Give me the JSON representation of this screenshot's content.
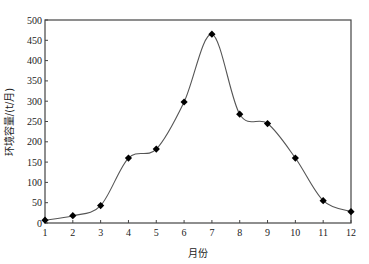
{
  "chart_data": {
    "type": "line",
    "title": "",
    "xlabel": "月份",
    "ylabel": "环境容量/(t/月)",
    "x": [
      1,
      2,
      3,
      4,
      5,
      6,
      7,
      8,
      9,
      10,
      11,
      12
    ],
    "categories": [
      "1",
      "2",
      "3",
      "4",
      "5",
      "6",
      "7",
      "8",
      "9",
      "10",
      "11",
      "12"
    ],
    "series": [
      {
        "name": "环境容量",
        "values": [
          7,
          18,
          43,
          160,
          182,
          298,
          465,
          268,
          245,
          160,
          55,
          28
        ],
        "marker": "diamond",
        "line": "smooth",
        "color": "#000000",
        "line_color": "#555555"
      }
    ],
    "xlim": [
      1,
      12
    ],
    "ylim": [
      0,
      500
    ],
    "yticks": [
      0,
      50,
      100,
      150,
      200,
      250,
      300,
      350,
      400,
      450,
      500
    ],
    "xticks": [
      1,
      2,
      3,
      4,
      5,
      6,
      7,
      8,
      9,
      10,
      11,
      12
    ],
    "grid": false,
    "legend": "none"
  },
  "plot": {
    "left": 45,
    "right": 351,
    "top": 20,
    "bottom": 223
  }
}
